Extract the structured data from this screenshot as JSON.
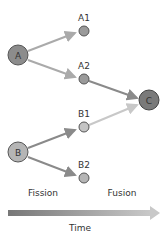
{
  "nodes": {
    "A": {
      "label": "A",
      "x": 18,
      "y": 55,
      "r": 10,
      "fill": "#8c8c8c"
    },
    "A1": {
      "label": "A1",
      "x": 84,
      "y": 31,
      "r": 5,
      "fill": "#9a9a9a"
    },
    "A2": {
      "label": "A2",
      "x": 84,
      "y": 79,
      "r": 5,
      "fill": "#9a9a9a"
    },
    "B": {
      "label": "B",
      "x": 18,
      "y": 152,
      "r": 10,
      "fill": "#b5b5b5"
    },
    "B1": {
      "label": "B1",
      "x": 84,
      "y": 127,
      "r": 5,
      "fill": "#c4c4c4"
    },
    "B2": {
      "label": "B2",
      "x": 84,
      "y": 178,
      "r": 5,
      "fill": "#b5b5b5"
    },
    "C": {
      "label": "C",
      "x": 149,
      "y": 100,
      "r": 10,
      "fill": "#7a7a7a"
    }
  },
  "phases": {
    "fission": "Fission",
    "fusion": "Fusion"
  },
  "axis": {
    "label": "Time"
  }
}
